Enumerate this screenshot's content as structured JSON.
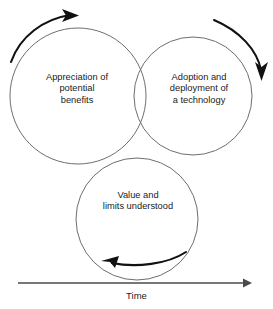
{
  "diagram": {
    "stroke_color_circles": "#6e6e6e",
    "stroke_color_arrows": "#111111",
    "background_color": "#ffffff",
    "circles": [
      {
        "id": "appreciation",
        "lines": [
          "Appreciation of",
          "potential",
          "benefits"
        ],
        "cx": 78,
        "cy": 96,
        "r": 68
      },
      {
        "id": "adoption",
        "lines": [
          "Adoption and",
          "deployment of",
          "a technology"
        ],
        "cx": 193,
        "cy": 96,
        "r": 59
      },
      {
        "id": "value",
        "lines": [
          "Value and",
          "limits understood"
        ],
        "cx": 137,
        "cy": 219,
        "r": 61
      }
    ],
    "arrows": [
      {
        "id": "top-left-arrow",
        "direction": "clockwise-right"
      },
      {
        "id": "right-arrow",
        "direction": "clockwise-down"
      },
      {
        "id": "bottom-arrow",
        "direction": "counter-right-to-left"
      }
    ],
    "axis": {
      "label": "Time",
      "direction": "left-to-right",
      "x_start": 18,
      "x_end": 250,
      "y": 283
    }
  }
}
